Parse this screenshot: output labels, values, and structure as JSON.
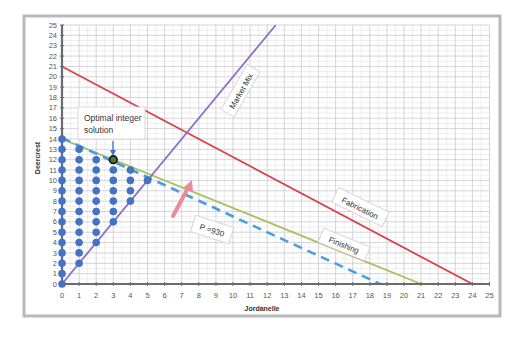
{
  "chart_data": {
    "type": "line",
    "title": "",
    "xlabel": "Jordanelle",
    "ylabel": "Deercrest",
    "xlim": [
      0,
      25
    ],
    "ylim": [
      0,
      25
    ],
    "grid": true,
    "x_ticks": [
      0,
      1,
      2,
      3,
      4,
      5,
      6,
      7,
      8,
      9,
      10,
      11,
      12,
      13,
      14,
      15,
      16,
      17,
      18,
      19,
      20,
      21,
      22,
      23,
      24,
      25
    ],
    "y_ticks": [
      0,
      1,
      2,
      3,
      4,
      5,
      6,
      7,
      8,
      9,
      10,
      11,
      12,
      13,
      14,
      15,
      16,
      17,
      18,
      19,
      20,
      21,
      22,
      23,
      24,
      25
    ],
    "series": [
      {
        "name": "Fabrication",
        "color": "#d9414b",
        "style": "solid",
        "points": [
          [
            0,
            21
          ],
          [
            24,
            0
          ]
        ]
      },
      {
        "name": "Finishing",
        "color": "#a9bf5a",
        "style": "solid",
        "points": [
          [
            0,
            14
          ],
          [
            21,
            0
          ]
        ]
      },
      {
        "name": "Market Mix",
        "color": "#8a6fc7",
        "style": "solid",
        "points": [
          [
            0,
            0
          ],
          [
            12.5,
            25
          ]
        ]
      },
      {
        "name": "P =930",
        "color": "#4a9fd8",
        "style": "dashed",
        "points": [
          [
            0,
            14.1
          ],
          [
            18.6,
            0
          ]
        ]
      }
    ],
    "feasible_integer_points": [
      [
        0,
        0
      ],
      [
        0,
        1
      ],
      [
        0,
        2
      ],
      [
        0,
        3
      ],
      [
        0,
        4
      ],
      [
        0,
        5
      ],
      [
        0,
        6
      ],
      [
        0,
        7
      ],
      [
        0,
        8
      ],
      [
        0,
        9
      ],
      [
        0,
        10
      ],
      [
        0,
        11
      ],
      [
        0,
        12
      ],
      [
        0,
        13
      ],
      [
        0,
        14
      ],
      [
        1,
        2
      ],
      [
        1,
        3
      ],
      [
        1,
        4
      ],
      [
        1,
        5
      ],
      [
        1,
        6
      ],
      [
        1,
        7
      ],
      [
        1,
        8
      ],
      [
        1,
        9
      ],
      [
        1,
        10
      ],
      [
        1,
        11
      ],
      [
        1,
        12
      ],
      [
        1,
        13
      ],
      [
        2,
        4
      ],
      [
        2,
        5
      ],
      [
        2,
        6
      ],
      [
        2,
        7
      ],
      [
        2,
        8
      ],
      [
        2,
        9
      ],
      [
        2,
        10
      ],
      [
        2,
        11
      ],
      [
        2,
        12
      ],
      [
        3,
        6
      ],
      [
        3,
        7
      ],
      [
        3,
        8
      ],
      [
        3,
        9
      ],
      [
        3,
        10
      ],
      [
        3,
        11
      ],
      [
        4,
        8
      ],
      [
        4,
        9
      ],
      [
        4,
        10
      ],
      [
        4,
        11
      ],
      [
        5,
        10
      ]
    ],
    "optimal_point": [
      3,
      12
    ],
    "point_color": "#4472c4",
    "annotations": [
      {
        "text": "Optimal integer solution",
        "target": [
          3,
          12
        ]
      },
      {
        "text": "Market Mix",
        "on_series": "Market Mix"
      },
      {
        "text": "Fabrication",
        "on_series": "Fabrication"
      },
      {
        "text": "Finishing",
        "on_series": "Finishing"
      },
      {
        "text": "P =930",
        "on_series": "P =930"
      }
    ],
    "arrow": {
      "color": "#e88c9a",
      "direction": "increasing profit"
    }
  },
  "labels": {
    "xlabel": "Jordanelle",
    "ylabel": "Deercrest",
    "callout_line1": "Optimal integer",
    "callout_line2": "solution",
    "market_mix": "Market Mix",
    "fabrication": "Fabrication",
    "finishing": "Finishing",
    "profit": "P =930"
  }
}
